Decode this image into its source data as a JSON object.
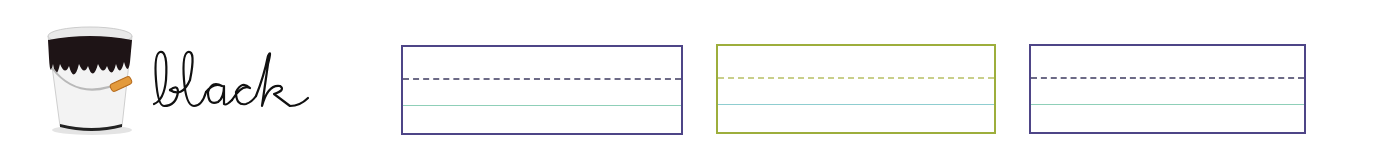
{
  "worksheet": {
    "color_word": "black",
    "image": {
      "name": "paint-bucket",
      "paint_color": "#1e1416"
    },
    "writing_boxes": [
      {
        "left": 401,
        "top": 45,
        "width": 282,
        "height": 90,
        "border_color": "#4e4587",
        "dash_color": "#6c6a86",
        "baseline_color": "#8fcfb8"
      },
      {
        "left": 716,
        "top": 44,
        "width": 280,
        "height": 90,
        "border_color": "#9dae3c",
        "dash_color": "#c9cf8a",
        "baseline_color": "#8fcdd0"
      },
      {
        "left": 1029,
        "top": 44,
        "width": 277,
        "height": 90,
        "border_color": "#4e4587",
        "dash_color": "#6c6a86",
        "baseline_color": "#8fcfb8"
      }
    ]
  }
}
